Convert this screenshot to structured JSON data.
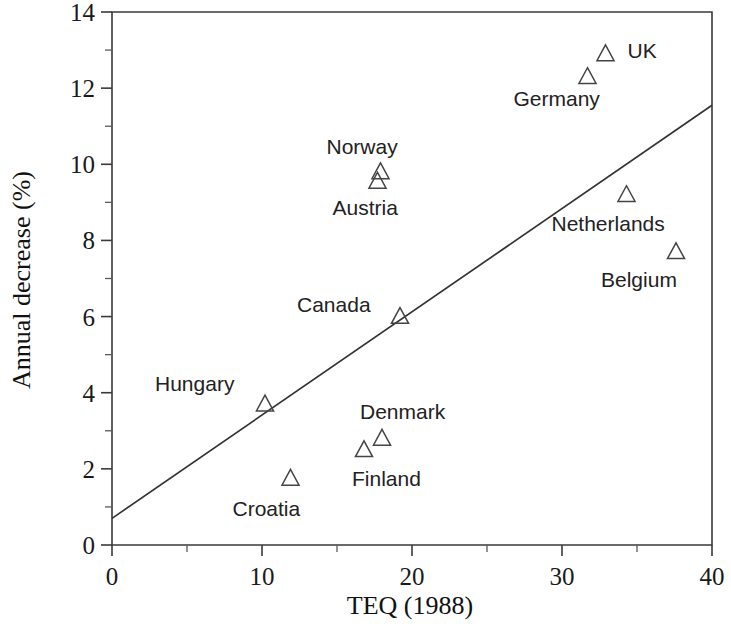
{
  "chart_data": {
    "type": "scatter",
    "title": "",
    "xlabel": "TEQ (1988)",
    "ylabel": "Annual decrease (%)",
    "xlim": [
      0,
      40
    ],
    "ylim": [
      0,
      14
    ],
    "x_ticks_major": [
      0,
      10,
      20,
      30,
      40
    ],
    "x_ticks_minor": [
      5,
      15,
      25,
      35
    ],
    "y_ticks_major": [
      0,
      2,
      4,
      6,
      8,
      10,
      12,
      14
    ],
    "y_ticks_minor": [
      1,
      3,
      5,
      7,
      9,
      11,
      13
    ],
    "grid": false,
    "legend": "none",
    "marker": "open-triangle",
    "points": [
      {
        "label": "UK",
        "x": 32.9,
        "y": 12.9,
        "label_dx": 22,
        "label_dy": 4
      },
      {
        "label": "Germany",
        "x": 31.7,
        "y": 12.3,
        "label_dx": -74,
        "label_dy": 29
      },
      {
        "label": "Norway",
        "x": 17.9,
        "y": 9.8,
        "label_dx": -54,
        "label_dy": -18
      },
      {
        "label": "Austria",
        "x": 17.7,
        "y": 9.55,
        "label_dx": -45,
        "label_dy": 34
      },
      {
        "label": "Netherlands",
        "x": 34.3,
        "y": 9.2,
        "label_dx": -75,
        "label_dy": 36
      },
      {
        "label": "Belgium",
        "x": 37.6,
        "y": 7.7,
        "label_dx": -75,
        "label_dy": 35
      },
      {
        "label": "Canada",
        "x": 19.2,
        "y": 6.0,
        "label_dx": -103,
        "label_dy": -5
      },
      {
        "label": "Hungary",
        "x": 10.2,
        "y": 3.7,
        "label_dx": -110,
        "label_dy": -13
      },
      {
        "label": "Denmark",
        "x": 18.0,
        "y": 2.8,
        "label_dx": -22,
        "label_dy": -19
      },
      {
        "label": "Finland",
        "x": 16.8,
        "y": 2.5,
        "label_dx": -12,
        "label_dy": 36
      },
      {
        "label": "Croatia",
        "x": 11.9,
        "y": 1.75,
        "label_dx": -58,
        "label_dy": 38
      }
    ],
    "trend_line": {
      "x_start": 0,
      "y_start": 0.7,
      "x_end": 40,
      "y_end": 11.55
    },
    "colors": {
      "axis": "#3a3a3a",
      "marker": "#444444",
      "trend": "#333333",
      "text": "#1a1a1a",
      "background": "#ffffff"
    }
  }
}
